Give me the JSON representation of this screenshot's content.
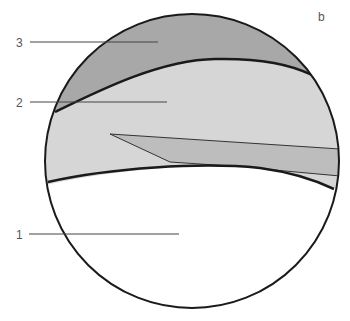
{
  "figure": {
    "panel_label": "b",
    "labels": [
      {
        "id": "3",
        "text": "3"
      },
      {
        "id": "2",
        "text": "2"
      },
      {
        "id": "1",
        "text": "1"
      }
    ]
  },
  "colors": {
    "layer3": "#a8a8a8",
    "layer2": "#d6d6d6",
    "wedge": "#bdbdbd",
    "layer1": "#ffffff",
    "outline": "#1a1a1a",
    "leader": "#444444"
  }
}
